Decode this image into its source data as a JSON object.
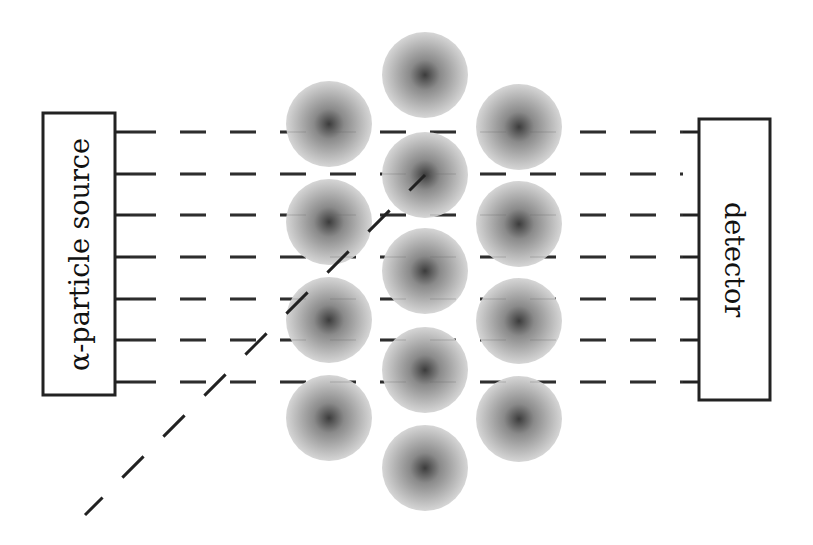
{
  "diagram": {
    "source": {
      "label": "α-particle source",
      "box": {
        "x": 43,
        "y": 113,
        "w": 72,
        "h": 282
      }
    },
    "detector": {
      "label": "detector",
      "box": {
        "x": 699,
        "y": 119,
        "w": 71,
        "h": 281
      }
    },
    "beam_rows_y": [
      132,
      174,
      215,
      257,
      299,
      340,
      382
    ],
    "source_ticks_y": [
      132,
      174,
      215,
      257,
      299,
      340,
      382
    ],
    "detector_ticks_y": [
      132,
      215,
      257,
      299,
      340,
      382
    ],
    "atoms": [
      {
        "x": 329,
        "y": 124
      },
      {
        "x": 329,
        "y": 222
      },
      {
        "x": 329,
        "y": 320
      },
      {
        "x": 329,
        "y": 418
      },
      {
        "x": 425,
        "y": 75
      },
      {
        "x": 425,
        "y": 175
      },
      {
        "x": 425,
        "y": 271
      },
      {
        "x": 425,
        "y": 370
      },
      {
        "x": 425,
        "y": 468
      },
      {
        "x": 519,
        "y": 127
      },
      {
        "x": 519,
        "y": 224
      },
      {
        "x": 519,
        "y": 321
      },
      {
        "x": 519,
        "y": 419
      }
    ],
    "atom_radius": 43,
    "scattered_path": {
      "from": {
        "x": 425,
        "y": 175
      },
      "to": {
        "x": 85,
        "y": 515
      }
    },
    "colors": {
      "line": "#222222",
      "atom_center": "#3a3a3a",
      "atom_edge": "#d8d8d8",
      "background": "#ffffff"
    }
  }
}
